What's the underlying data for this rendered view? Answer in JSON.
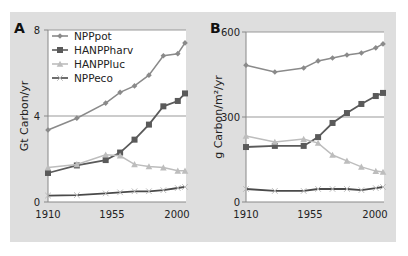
{
  "chart_data": [
    {
      "panel": "A",
      "type": "line",
      "title": "",
      "xlabel": "",
      "ylabel": "Gt Carbon/yr",
      "x": [
        1910,
        1930,
        1950,
        1960,
        1970,
        1980,
        1990,
        2000,
        2005
      ],
      "xticks": [
        1910,
        1955,
        2000
      ],
      "yticks": [
        0,
        4,
        8
      ],
      "ylim": [
        0,
        8
      ],
      "xlim": [
        1910,
        2005
      ],
      "grid": "horizontal line at 4",
      "legend_position": "upper left",
      "series": [
        {
          "name": "NPPpot",
          "marker": "diamond",
          "color": "#8a8a8a",
          "values": [
            3.35,
            3.9,
            4.6,
            5.1,
            5.4,
            5.9,
            6.8,
            6.9,
            7.4
          ]
        },
        {
          "name": "HANPPharv",
          "marker": "square",
          "color": "#5a5a5a",
          "values": [
            1.35,
            1.7,
            1.95,
            2.3,
            2.9,
            3.6,
            4.45,
            4.7,
            5.05
          ]
        },
        {
          "name": "HANPPluc",
          "marker": "triangle",
          "color": "#bdbdbd",
          "values": [
            1.6,
            1.75,
            2.2,
            2.15,
            1.75,
            1.65,
            1.6,
            1.45,
            1.45
          ]
        },
        {
          "name": "NPPeco",
          "marker": "cross",
          "color": "#4a4a4a",
          "values": [
            0.3,
            0.32,
            0.4,
            0.45,
            0.5,
            0.5,
            0.55,
            0.65,
            0.7
          ]
        }
      ]
    },
    {
      "panel": "B",
      "type": "line",
      "title": "",
      "xlabel": "",
      "ylabel": "g Carbon/m²/yr",
      "x": [
        1910,
        1930,
        1950,
        1960,
        1970,
        1980,
        1990,
        2000,
        2005
      ],
      "xticks": [
        1910,
        1955,
        2000
      ],
      "yticks": [
        0,
        300,
        600
      ],
      "ylim": [
        0,
        600
      ],
      "xlim": [
        1910,
        2005
      ],
      "grid": "horizontal line at 300",
      "series": [
        {
          "name": "NPPpot",
          "marker": "diamond",
          "color": "#8a8a8a",
          "values": [
            483,
            459,
            473,
            498,
            508,
            519,
            526,
            544,
            558
          ]
        },
        {
          "name": "HANPPharv",
          "marker": "square",
          "color": "#5a5a5a",
          "values": [
            194,
            198,
            198,
            229,
            279,
            314,
            346,
            374,
            385
          ]
        },
        {
          "name": "HANPPluc",
          "marker": "triangle",
          "color": "#bdbdbd",
          "values": [
            233,
            212,
            222,
            208,
            166,
            145,
            124,
            109,
            106
          ]
        },
        {
          "name": "NPPeco",
          "marker": "cross",
          "color": "#4a4a4a",
          "values": [
            46,
            39,
            39,
            46,
            46,
            46,
            42,
            49,
            53
          ]
        }
      ]
    }
  ],
  "panels": {
    "a": {
      "letter": "A",
      "ylabel": "Gt Carbon/yr",
      "yticks": [
        "0",
        "4",
        "8"
      ],
      "xticks": [
        "1910",
        "1955",
        "2000"
      ]
    },
    "b": {
      "letter": "B",
      "ylabel": "g Carbon/m²/yr",
      "yticks": [
        "0",
        "300",
        "600"
      ],
      "xticks": [
        "1910",
        "1955",
        "2000"
      ]
    }
  },
  "legend": [
    "NPPpot",
    "HANPPharv",
    "HANPPluc",
    "NPPeco"
  ]
}
